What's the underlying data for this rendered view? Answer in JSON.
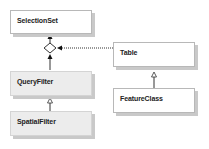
{
  "diagram": {
    "type": "uml-class-diagram",
    "classes": [
      {
        "id": "selectionset",
        "label": "SelectionSet",
        "style": "white"
      },
      {
        "id": "queryfilter",
        "label": "QueryFilter",
        "style": "gray"
      },
      {
        "id": "spatialfilter",
        "label": "SpatialFilter",
        "style": "gray"
      },
      {
        "id": "table",
        "label": "Table",
        "style": "white"
      },
      {
        "id": "featureclass",
        "label": "FeatureClass",
        "style": "white"
      }
    ],
    "relationships": [
      {
        "from": "diamond",
        "to": "selectionset",
        "kind": "association-arrow"
      },
      {
        "from": "queryfilter",
        "to": "diamond",
        "kind": "association-arrow"
      },
      {
        "from": "table",
        "to": "diamond",
        "kind": "dependency-dotted-arrow"
      },
      {
        "from": "spatialfilter",
        "to": "queryfilter",
        "kind": "inheritance"
      },
      {
        "from": "featureclass",
        "to": "table",
        "kind": "inheritance"
      }
    ],
    "colors": {
      "border": "#b8b8b8",
      "shadow": "#c9c9c9",
      "gray_fill": "#ececec",
      "line": "#333333"
    }
  }
}
